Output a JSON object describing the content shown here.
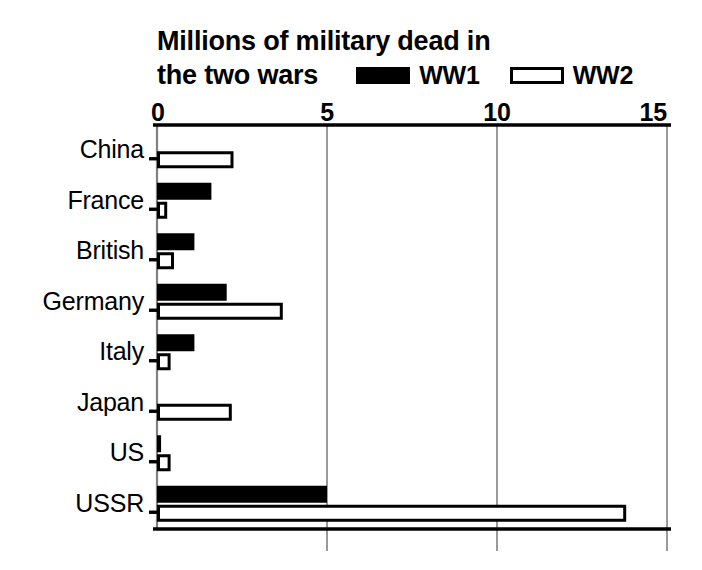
{
  "title": {
    "line1": "Millions of military dead in",
    "line2": "the two wars"
  },
  "legend": {
    "items": [
      {
        "label": "WW1",
        "style": "filled",
        "color": "#000000"
      },
      {
        "label": "WW2",
        "style": "outlined",
        "color": "#FFFFFF"
      }
    ]
  },
  "axis": {
    "ticks": [
      "0",
      "5",
      "10",
      "15"
    ]
  },
  "colors": {
    "ww1": "#000000",
    "ww2": "#FFFFFF",
    "outline": "#000000",
    "gridline": "#808080",
    "axis": "#000000",
    "background": "#FFFFFF"
  },
  "chart_data": {
    "type": "bar",
    "orientation": "horizontal",
    "title": "Millions of military dead in the two wars",
    "xlabel": "",
    "ylabel": "",
    "xlim": [
      0,
      15
    ],
    "ylim": null,
    "grid": true,
    "gridlines_x": [
      0,
      5,
      10,
      15
    ],
    "legend_position": "top-right",
    "categories": [
      "China",
      "France",
      "British",
      "Germany",
      "Italy",
      "Japan",
      "US",
      "USSR"
    ],
    "series": [
      {
        "name": "WW1",
        "fill": "#000000",
        "values": [
          0,
          1.6,
          1.1,
          2.05,
          1.1,
          0,
          0.12,
          5.0
        ]
      },
      {
        "name": "WW2",
        "fill": "#FFFFFF",
        "values": [
          2.25,
          0.3,
          0.5,
          3.7,
          0.4,
          2.2,
          0.4,
          13.8
        ]
      }
    ],
    "units": "millions"
  }
}
